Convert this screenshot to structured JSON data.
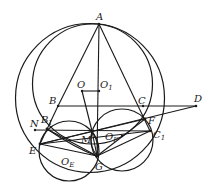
{
  "diagram": {
    "type": "geometry-figure",
    "colors": {
      "stroke": "#1a1a1a",
      "background": "#ffffff"
    },
    "points": {
      "A": {
        "label": "A",
        "x": 99,
        "y": 24
      },
      "O": {
        "label": "O",
        "x": 82,
        "y": 91
      },
      "O1": {
        "label": "O",
        "sub": "1",
        "x": 99,
        "y": 91
      },
      "B": {
        "label": "B",
        "x": 58,
        "y": 106
      },
      "C": {
        "label": "C",
        "x": 143,
        "y": 106
      },
      "D": {
        "label": "D",
        "x": 196,
        "y": 106
      },
      "N": {
        "label": "N",
        "x": 35,
        "y": 130
      },
      "B1": {
        "label": "B",
        "sub": "1",
        "x": 47,
        "y": 129
      },
      "E": {
        "label": "E",
        "x": 40,
        "y": 144
      },
      "M": {
        "label": "M",
        "x": 92,
        "y": 131
      },
      "G": {
        "label": "G",
        "x": 97,
        "y": 156
      },
      "F": {
        "label": "F",
        "x": 145,
        "y": 119
      },
      "C1": {
        "label": "C",
        "sub": "1",
        "x": 150,
        "y": 131
      },
      "OE": {
        "label": "O",
        "sub": "E",
        "x": 69,
        "y": 151
      },
      "OF": {
        "label": "O",
        "sub": "F",
        "x": 122,
        "y": 136
      }
    },
    "circles": [
      {
        "name": "outer-circle",
        "cx": 90,
        "cy": 98,
        "r": 74.5
      },
      {
        "name": "inner-circle",
        "cx": 92.5,
        "cy": 84,
        "r": 60
      },
      {
        "name": "circle-OE",
        "cx": 69,
        "cy": 151,
        "r": 30
      },
      {
        "name": "circle-OF",
        "cx": 122,
        "cy": 140,
        "r": 31
      }
    ],
    "segments": [
      [
        "A",
        "B"
      ],
      [
        "A",
        "C"
      ],
      [
        "A",
        "G"
      ],
      [
        "B",
        "D"
      ],
      [
        "O",
        "O1"
      ],
      [
        "O",
        "M"
      ],
      [
        "N",
        "C1"
      ],
      [
        "E",
        "D"
      ],
      [
        "E",
        "F"
      ],
      [
        "B1",
        "G"
      ],
      [
        "E",
        "G"
      ],
      [
        "F",
        "G"
      ],
      [
        "C1",
        "G"
      ],
      [
        "B1",
        "M"
      ],
      [
        "M",
        "G"
      ],
      [
        "E",
        "C1"
      ],
      [
        "B1",
        "F"
      ]
    ]
  }
}
